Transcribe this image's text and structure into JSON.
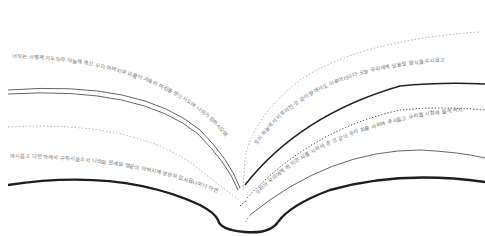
{
  "illustration": {
    "subject": "open book with curved lines of text",
    "colors": {
      "background": "#ffffff",
      "ink": "#222222",
      "thin_line": "#555555",
      "dotted_line": "#9a9a9a",
      "text": "#6e6e6e"
    }
  },
  "left_page": {
    "lines": [
      "너희는 이렇게 기도하라 하늘에 계신 우리 아버지여 이름이 거룩히 여김을 받으시오며 나라가 임하시오며",
      "뜻이 하늘에서 이루어진 것 같이 땅에서도 이루어지이다",
      "마시옵고 다만 악에서 구하시옵소서 나라와 권세와 영광이 아버지께 영원히 있사옵나이다 아멘"
    ]
  },
  "right_page": {
    "lines": [
      "뜻이 하늘에서 이루어진 것 같이 땅에서도 이루어지이다 오늘 우리에게 일용할 양식을 주시옵고",
      "우리가 우리에게 죄 지은 자를 사하여 준 것 같이 우리 죄를 사하여 주시옵고 우리를 시험에 들게 하지"
    ]
  }
}
